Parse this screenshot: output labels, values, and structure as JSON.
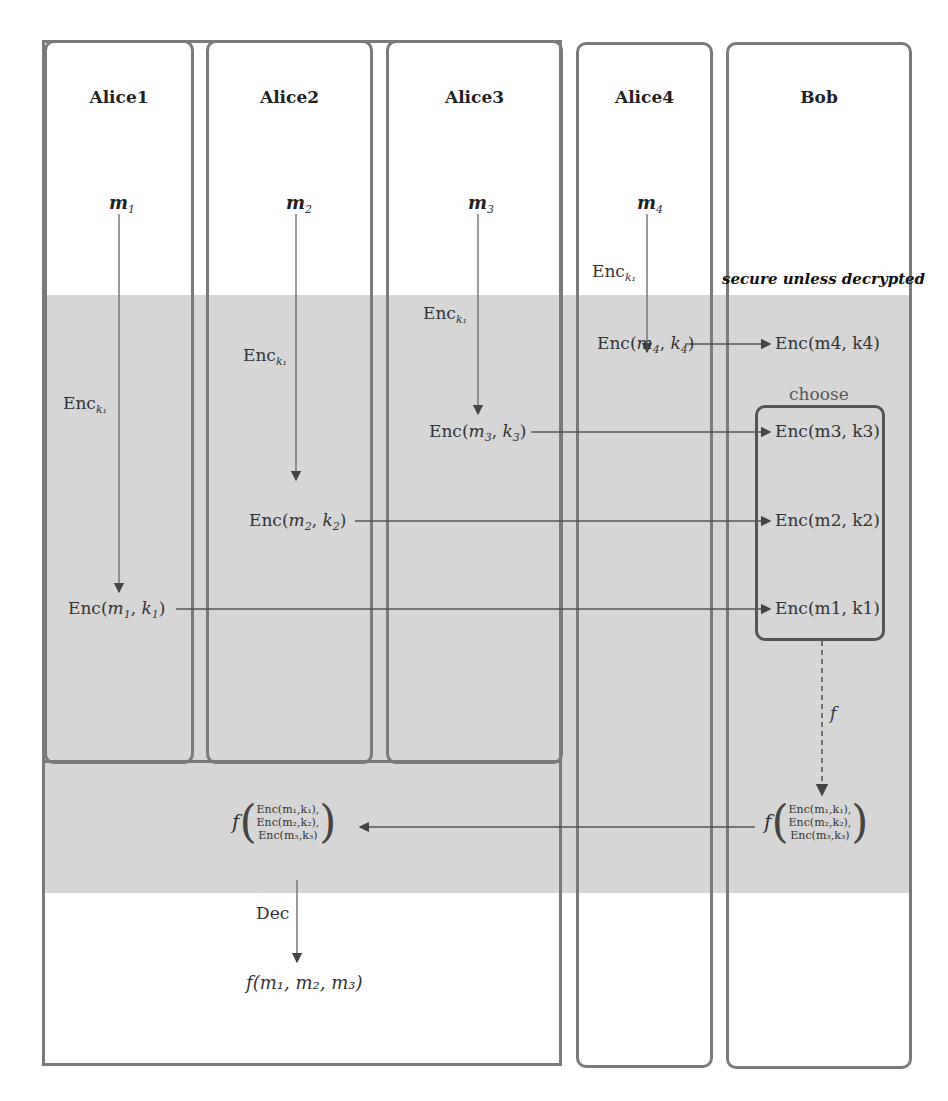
{
  "figure": {
    "parties": [
      {
        "name": "Alice1",
        "message": "m",
        "message_sub": "1",
        "enc_label": "Enc",
        "enc_sub": "k₁",
        "ciphertext": {
          "fn": "Enc(",
          "m": "m",
          "m_sub": "1",
          "k": "k",
          "k_sub": "1",
          "close": ")"
        }
      },
      {
        "name": "Alice2",
        "message": "m",
        "message_sub": "2",
        "enc_label": "Enc",
        "enc_sub": "k₁",
        "ciphertext": {
          "fn": "Enc(",
          "m": "m",
          "m_sub": "2",
          "k": "k",
          "k_sub": "2",
          "close": ")"
        }
      },
      {
        "name": "Alice3",
        "message": "m",
        "message_sub": "3",
        "enc_label": "Enc",
        "enc_sub": "k₁",
        "ciphertext": {
          "fn": "Enc(",
          "m": "m",
          "m_sub": "3",
          "k": "k",
          "k_sub": "3",
          "close": ")"
        }
      },
      {
        "name": "Alice4",
        "message": "m",
        "message_sub": "4",
        "enc_label": "Enc",
        "enc_sub": "k₁",
        "ciphertext": {
          "fn": "Enc(",
          "m": "m",
          "m_sub": "4",
          "k": "k",
          "k_sub": "4",
          "close": ")"
        }
      },
      {
        "name": "Bob"
      }
    ],
    "zone_label": "secure unless decrypted",
    "bob": {
      "received": [
        "Enc(m4, k4)",
        "Enc(m3, k3)",
        "Enc(m2, k2)",
        "Enc(m1, k1)"
      ],
      "choose_label": "choose",
      "function_label": "f",
      "result": {
        "f": "f",
        "lines": [
          "Enc(m₁,k₁),",
          "Enc(m₂,k₂),",
          "Enc(m₃,k₃)"
        ]
      }
    },
    "alices_combined": {
      "received": {
        "f": "f",
        "lines": [
          "Enc(m₁,k₁),",
          "Enc(m₂,k₂),",
          "Enc(m₃,k₃)"
        ]
      },
      "dec_label": "Dec",
      "output": "f(m₁, m₂, m₃)"
    },
    "colors": {
      "secure_band": "#d6d6d6",
      "border": "#7a7a7a",
      "arrow": "#555555"
    }
  }
}
